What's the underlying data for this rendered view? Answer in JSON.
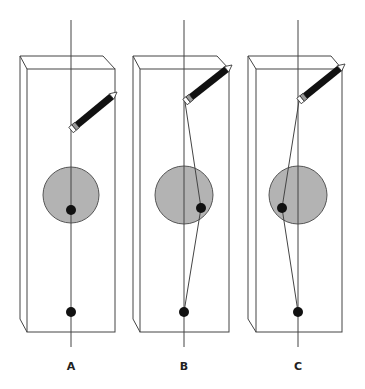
{
  "panels": [
    {
      "label": "A",
      "axis_x": 71,
      "box": {
        "back_left": 20,
        "back_right": 103,
        "front_left": 27,
        "front_right": 115,
        "back_top": 56,
        "front_top": 69,
        "back_bottom": 319,
        "front_bottom": 332
      },
      "circle": {
        "cx": 71,
        "cy": 195,
        "r": 28
      },
      "pencil_tip": [
        71,
        130
      ],
      "pencil_end": [
        117,
        92
      ],
      "dot_upper": [
        71,
        210
      ],
      "dot_lower": [
        71,
        312
      ],
      "path": []
    },
    {
      "label": "B",
      "axis_x": 184,
      "box": {
        "back_left": 133,
        "back_right": 217,
        "front_left": 140,
        "front_right": 229,
        "back_top": 56,
        "front_top": 69,
        "back_bottom": 319,
        "front_bottom": 332
      },
      "circle": {
        "cx": 184,
        "cy": 195,
        "r": 29
      },
      "pencil_tip": [
        185,
        102
      ],
      "pencil_end": [
        232,
        65
      ],
      "dot_upper": [
        201,
        208
      ],
      "dot_lower": [
        184,
        312
      ],
      "path": [
        [
          185,
          102
        ],
        [
          201,
          208
        ],
        [
          184,
          312
        ]
      ]
    },
    {
      "label": "C",
      "axis_x": 298,
      "box": {
        "back_left": 248,
        "back_right": 331,
        "front_left": 256,
        "front_right": 342,
        "back_top": 56,
        "front_top": 69,
        "back_bottom": 319,
        "front_bottom": 332
      },
      "circle": {
        "cx": 298,
        "cy": 195,
        "r": 29
      },
      "pencil_tip": [
        299,
        101
      ],
      "pencil_end": [
        345,
        64
      ],
      "dot_upper": [
        282,
        208
      ],
      "dot_lower": [
        298,
        312
      ],
      "path": [
        [
          299,
          101
        ],
        [
          282,
          208
        ],
        [
          298,
          312
        ]
      ]
    }
  ],
  "axis": {
    "top": 20,
    "bottom": 347
  },
  "colors": {
    "line": "#444444",
    "circle_fill": "#b3b3b3",
    "circle_stroke": "#555555",
    "dot": "#111111",
    "pencil": "#111111"
  }
}
